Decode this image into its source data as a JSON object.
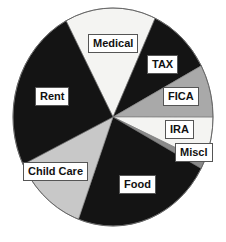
{
  "chart_data": {
    "type": "pie",
    "title": "",
    "legend": "none (labels on slices)",
    "start_angle_deg": 332,
    "direction": "clockwise",
    "slices": [
      {
        "label": "Medical",
        "value": 14.7,
        "color": "#f4f4f2"
      },
      {
        "label": "TAX",
        "value": 10.3,
        "color": "#141414"
      },
      {
        "label": "FICA",
        "value": 7.8,
        "color": "#a9a9a9"
      },
      {
        "label": "IRA",
        "value": 6.7,
        "color": "#f4f4f2"
      },
      {
        "label": "Miscl",
        "value": 1.1,
        "color": "#8a8a8a"
      },
      {
        "label": "Food",
        "value": 22.8,
        "color": "#141414"
      },
      {
        "label": "Child Care",
        "value": 12.2,
        "color": "#c8c8c8"
      },
      {
        "label": "Rent",
        "value": 24.4,
        "color": "#141414"
      }
    ],
    "labels": [
      {
        "text": "Medical",
        "x": 88,
        "y": 34
      },
      {
        "text": "TAX",
        "x": 147,
        "y": 55
      },
      {
        "text": "FICA",
        "x": 163,
        "y": 87
      },
      {
        "text": "IRA",
        "x": 165,
        "y": 120
      },
      {
        "text": "Miscl",
        "x": 175,
        "y": 143
      },
      {
        "text": "Food",
        "x": 119,
        "y": 175
      },
      {
        "text": "Child Care",
        "x": 23,
        "y": 162
      },
      {
        "text": "Rent",
        "x": 35,
        "y": 87
      }
    ]
  },
  "geometry": {
    "cx": 113,
    "cy": 117,
    "rx": 100,
    "ry": 109
  }
}
